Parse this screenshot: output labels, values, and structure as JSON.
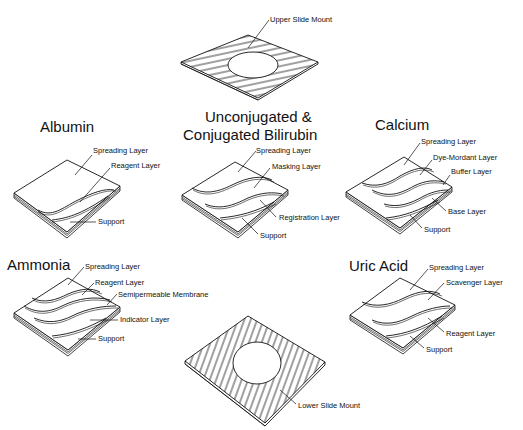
{
  "diagram": {
    "upper_mount": {
      "label": "Upper Slide Mount"
    },
    "lower_mount": {
      "label": "Lower Slide Mount"
    },
    "slides": [
      {
        "id": "albumin",
        "title": "Albumin",
        "layers": [
          "Spreading Layer",
          "Reagent Layer",
          "Support"
        ]
      },
      {
        "id": "bilirubin",
        "title_line1": "Unconjugated &",
        "title_line2": "Conjugated Bilirubin",
        "layers": [
          "Spreading Layer",
          "Masking Layer",
          "Registration Layer",
          "Support"
        ]
      },
      {
        "id": "calcium",
        "title": "Calcium",
        "layers": [
          "Spreading Layer",
          "Dye-Mordant Layer",
          "Buffer Layer",
          "Base Layer",
          "Support"
        ]
      },
      {
        "id": "ammonia",
        "title": "Ammonia",
        "layers": [
          "Spreading Layer",
          "Reagent Layer",
          "Semipermeable Membrane",
          "Indicator Layer",
          "Support"
        ]
      },
      {
        "id": "uric-acid",
        "title": "Uric Acid",
        "layers": [
          "Spreading Layer",
          "Scavenger Layer",
          "Reagent Layer",
          "Support"
        ]
      }
    ]
  }
}
